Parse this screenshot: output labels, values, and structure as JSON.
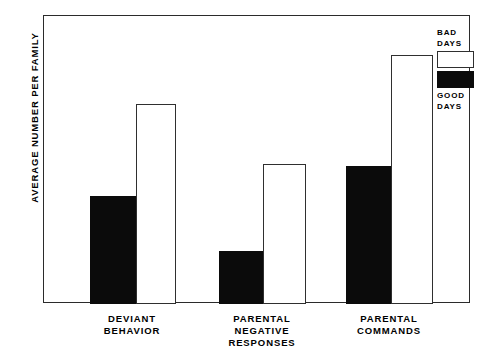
{
  "chart_data": {
    "type": "bar",
    "title": "",
    "xlabel": "",
    "ylabel": "AVERAGE NUMBER PER FAMILY",
    "ylim": [
      0,
      155
    ],
    "yticks": [
      0,
      25,
      50,
      75,
      100,
      125,
      150
    ],
    "ytick_labels": [
      "0",
      "25",
      "50",
      "75",
      "100",
      "125",
      "150"
    ],
    "grid": false,
    "legend_position": "top-right-outside",
    "categories": [
      "DEVIANT\nBEHAVIOR",
      "PARENTAL\nNEGATIVE\nRESPONSES",
      "PARENTAL\nCOMMANDS"
    ],
    "series": [
      {
        "name": "GOOD\nDAYS",
        "style": "filled-black",
        "color": "#0b0b0b",
        "values": [
          61,
          30,
          78
        ]
      },
      {
        "name": "BAD\nDAYS",
        "style": "outlined-white",
        "color": "#ffffff",
        "values": [
          113,
          79,
          141
        ]
      }
    ]
  },
  "axis": {
    "y_title": "AVERAGE NUMBER PER FAMILY",
    "ticks": [
      {
        "value": 150,
        "label": "150"
      },
      {
        "value": 125,
        "label": "125"
      },
      {
        "value": 100,
        "label": "100"
      },
      {
        "value": 75,
        "label": "75"
      },
      {
        "value": 50,
        "label": "50"
      },
      {
        "value": 25,
        "label": "25"
      },
      {
        "value": 0,
        "label": "0"
      }
    ]
  },
  "groups": [
    {
      "label": "DEVIANT\nBEHAVIOR",
      "good": 61,
      "bad": 113
    },
    {
      "label": "PARENTAL\nNEGATIVE\nRESPONSES",
      "good": 30,
      "bad": 79
    },
    {
      "label": "PARENTAL\nCOMMANDS",
      "good": 78,
      "bad": 141
    }
  ],
  "legend": {
    "bad_label": "BAD\nDAYS",
    "good_label": "GOOD\nDAYS"
  },
  "colors": {
    "good_days": "#0b0b0b",
    "bad_days": "#ffffff",
    "frame": "#2b2b2b",
    "background": "#ffffff"
  }
}
